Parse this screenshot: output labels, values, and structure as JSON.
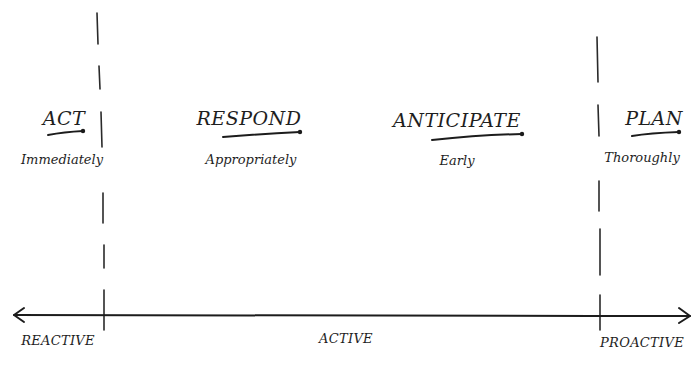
{
  "diagram": {
    "type": "spectrum",
    "stroke_color": "#222222",
    "background": "#ffffff",
    "stages": [
      {
        "heading": "ACT",
        "subtext": "Immediately"
      },
      {
        "heading": "RESPOND",
        "subtext": "Appropriately"
      },
      {
        "heading": "ANTICIPATE",
        "subtext": "Early"
      },
      {
        "heading": "PLAN",
        "subtext": "Thoroughly"
      }
    ],
    "axis": {
      "left_label": "REACTIVE",
      "center_label": "ACTIVE",
      "right_label": "PROACTIVE",
      "direction": "bidirectional"
    },
    "dividers": [
      {
        "name": "reactive-active-boundary",
        "style": "dashed"
      },
      {
        "name": "active-proactive-boundary",
        "style": "dashed"
      }
    ]
  }
}
